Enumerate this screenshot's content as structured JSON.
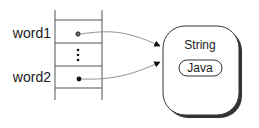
{
  "diagram": {
    "variables": [
      {
        "name": "word1",
        "points_to": "string_object"
      },
      {
        "name": "word2",
        "points_to": "string_object"
      }
    ],
    "ellipsis": "⋮",
    "object": {
      "type_label": "String",
      "value_label": "Java"
    },
    "colors": {
      "line": "#555555",
      "text": "#1a1a1a",
      "shadow": "#333333",
      "background": "#ffffff"
    }
  }
}
